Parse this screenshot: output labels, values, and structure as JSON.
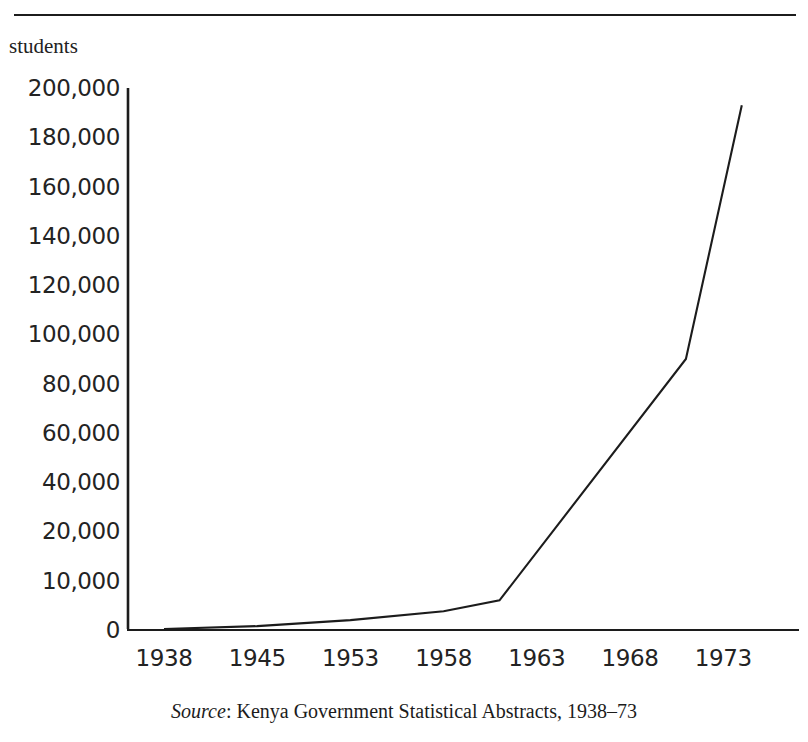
{
  "figure": {
    "y_axis_title": "students",
    "source_prefix": "Source",
    "source_separator": ": ",
    "source_text": "Kenya Government Statistical Abstracts, 1938–73",
    "line_color": "#1c1c1c",
    "axis_color": "#1c1c1c",
    "background": "#ffffff"
  },
  "chart_data": {
    "type": "line",
    "title": "",
    "subtitle": "",
    "xlabel": "",
    "ylabel": "students",
    "grid": false,
    "legend": null,
    "x_tick_labels": [
      "1938",
      "1945",
      "1953",
      "1958",
      "1963",
      "1968",
      "1973"
    ],
    "y_tick_labels": [
      "0",
      "10,000",
      "20,000",
      "40,000",
      "60,000",
      "80,000",
      "100,000",
      "120,000",
      "140,000",
      "160,000",
      "180,000",
      "200,000"
    ],
    "y_tick_values": [
      0,
      10000,
      20000,
      40000,
      60000,
      80000,
      100000,
      120000,
      140000,
      160000,
      180000,
      200000
    ],
    "y_axis_note": "Axis is evenly spaced by tick index; the 0–10,000–20,000 band is compressed relative to the 20,000 steps above it.",
    "ylim": [
      0,
      200000
    ],
    "xlim": [
      1938,
      1974
    ],
    "series": [
      {
        "name": "students",
        "x": [
          1938,
          1945,
          1953,
          1958,
          1961,
          1971,
          1974
        ],
        "values": [
          200,
          800,
          2000,
          3800,
          6000,
          90000,
          193000
        ]
      }
    ]
  }
}
